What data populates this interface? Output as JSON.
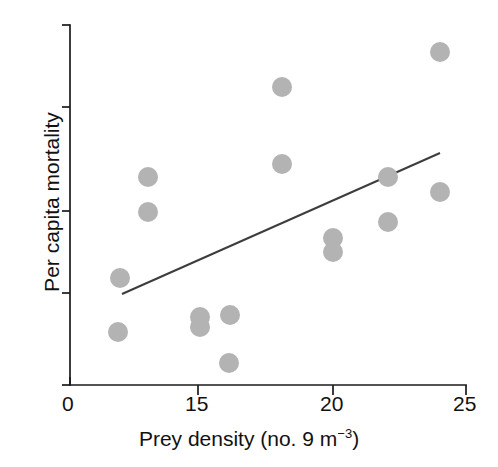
{
  "figure": {
    "width": 498,
    "height": 467,
    "background": "#ffffff",
    "marker_color": "#b3b3b3",
    "axis_color": "#1a1a1a",
    "line_color": "#3d3d3d"
  },
  "axes": {
    "x": {
      "label_prefix": "Prey density (no. 9 m",
      "label_exponent": "−3",
      "label_suffix": ")",
      "label_full": "Prey density (no. 9 m−3)",
      "ticks": [
        {
          "value": 0,
          "text": "0",
          "px": 70
        },
        {
          "value": 15,
          "text": "15",
          "px": 198
        },
        {
          "value": 20,
          "text": "20",
          "px": 333
        },
        {
          "value": 25,
          "text": "25",
          "px": 466
        }
      ],
      "axis_px": {
        "y": 385,
        "x_start": 70,
        "x_end": 466
      },
      "broken_axis": true
    },
    "y": {
      "label": "Per capita mortality",
      "ticks": [
        {
          "value": null,
          "text": "",
          "px": 25
        },
        {
          "value": null,
          "text": "",
          "px": 107
        },
        {
          "value": null,
          "text": "",
          "px": 211
        },
        {
          "value": null,
          "text": "",
          "px": 293
        },
        {
          "value": null,
          "text": "",
          "px": 385
        }
      ],
      "axis_px": {
        "x": 70,
        "y_top": 25,
        "y_bottom": 385
      },
      "tick_labels_shown": false
    }
  },
  "chart_data": {
    "type": "scatter",
    "title": "",
    "xlabel": "Prey density (no. 9 m−3)",
    "ylabel": "Per capita mortality",
    "xlim": [
      0,
      25
    ],
    "ylim": [
      0,
      1
    ],
    "grid": false,
    "legend": "none",
    "axis_note": "x-axis is broken between 0 and 15",
    "marker_style": "filled-circle-gray",
    "points": [
      {
        "x": 6,
        "y": 0.38
      },
      {
        "x": 6,
        "y": 0.2
      },
      {
        "x": 9,
        "y": 0.68
      },
      {
        "x": 9,
        "y": 0.57
      },
      {
        "x": 15,
        "y": 0.22
      },
      {
        "x": 15,
        "y": 0.17
      },
      {
        "x": 16,
        "y": 0.23
      },
      {
        "x": 16,
        "y": 0.07
      },
      {
        "x": 18,
        "y": 0.87
      },
      {
        "x": 18,
        "y": 0.63
      },
      {
        "x": 20,
        "y": 0.44
      },
      {
        "x": 20,
        "y": 0.4
      },
      {
        "x": 22,
        "y": 0.61
      },
      {
        "x": 22,
        "y": 0.49
      },
      {
        "x": 24,
        "y": 0.97
      },
      {
        "x": 24,
        "y": 0.57
      }
    ],
    "points_px": [
      {
        "cx": 120,
        "cy": 278
      },
      {
        "cx": 118,
        "cy": 332
      },
      {
        "cx": 148,
        "cy": 177
      },
      {
        "cx": 148,
        "cy": 212
      },
      {
        "cx": 200,
        "cy": 317
      },
      {
        "cx": 200,
        "cy": 327
      },
      {
        "cx": 230,
        "cy": 315
      },
      {
        "cx": 229,
        "cy": 363
      },
      {
        "cx": 282,
        "cy": 87
      },
      {
        "cx": 282,
        "cy": 164
      },
      {
        "cx": 333,
        "cy": 238
      },
      {
        "cx": 333,
        "cy": 252
      },
      {
        "cx": 388,
        "cy": 177
      },
      {
        "cx": 388,
        "cy": 222
      },
      {
        "cx": 440,
        "cy": 52
      },
      {
        "cx": 440,
        "cy": 192
      }
    ],
    "marker_radius_px": 10,
    "fit_line": {
      "type": "linear-regression",
      "x_start": 6.2,
      "y_start": 0.295,
      "x_end": 24.2,
      "y_end": 0.69,
      "px": {
        "x1": 122,
        "y1": 294,
        "x2": 440,
        "y2": 153
      }
    }
  }
}
